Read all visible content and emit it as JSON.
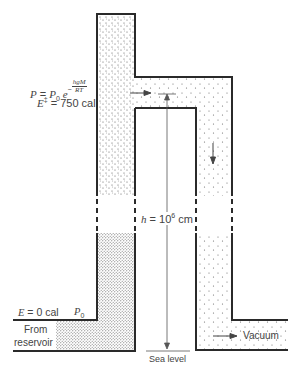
{
  "figure": {
    "caption_fragment": "Figure ...",
    "labels": {
      "pressure_eq_lhs": "P",
      "pressure_eq_eq": " = ",
      "pressure_eq_p0": "P",
      "pressure_eq_p0_sub": "0",
      "pressure_eq_exp_base": "e",
      "pressure_eq_exp_sign": "−",
      "pressure_eq_exp_num": "hgM",
      "pressure_eq_exp_den": "RT",
      "energy_top_lhs": "E",
      "energy_top_sup": "‡",
      "energy_top_value": " = 750 cal",
      "height_lhs": "h",
      "height_value": " = 10",
      "height_exp": "6",
      "height_unit": " cm",
      "energy_bottom_lhs": "E",
      "energy_bottom_value": " = 0 cal",
      "p0_bottom": "P",
      "p0_bottom_sub": "0",
      "from": "From",
      "reservoir": "reservoir",
      "sea_level": "Sea level",
      "vacuum": "Vacuum"
    },
    "colors": {
      "wall": "#2a2a2a",
      "stipple": "#555555",
      "background": "#ffffff"
    }
  }
}
